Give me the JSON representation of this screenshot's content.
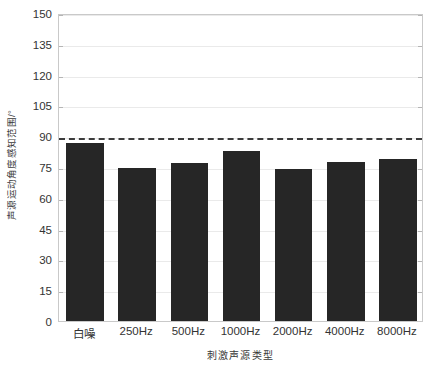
{
  "chart_data": {
    "type": "bar",
    "title": "",
    "subtitle": "",
    "xlabel": "刺激声源类型",
    "ylabel": "声源运动角度感知范围/°",
    "categories": [
      "白噪",
      "250Hz",
      "500Hz",
      "1000Hz",
      "2000Hz",
      "4000Hz",
      "8000Hz"
    ],
    "values": [
      86.5,
      74.5,
      77,
      83,
      74,
      77.5,
      79
    ],
    "series": [
      {
        "name": "声源运动角度感知范围",
        "values": [
          86.5,
          74.5,
          77,
          83,
          74,
          77.5,
          79
        ]
      }
    ],
    "ylim": [
      0,
      150
    ],
    "ytick_labels": [
      "0",
      "15",
      "30",
      "45",
      "60",
      "75",
      "90",
      "105",
      "120",
      "135",
      "150"
    ],
    "ytick_values": [
      0,
      15,
      30,
      45,
      60,
      75,
      90,
      105,
      120,
      135,
      150
    ],
    "grid": true,
    "legend": "none",
    "annotations": [
      {
        "name": "threshold-line",
        "type": "horizontal-dashed-line",
        "value": 90,
        "label": ""
      }
    ],
    "bar_color": "#262626",
    "threshold_color": "#3c3c3c",
    "grid_color": "#eaeaea",
    "axis_color": "#c9c9c9",
    "background": "#ffffff"
  }
}
